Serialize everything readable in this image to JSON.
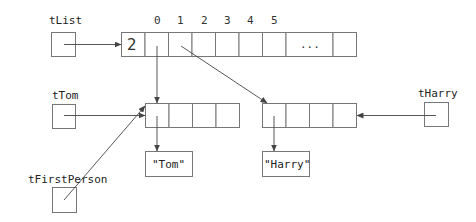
{
  "diagram": {
    "variables": {
      "tList": {
        "label": "tList"
      },
      "tTom": {
        "label": "tTom"
      },
      "tHarry": {
        "label": "tHarry"
      },
      "tFirstPerson": {
        "label": "tFirstPerson"
      }
    },
    "list_array": {
      "count_value": "2",
      "indices": [
        "0",
        "1",
        "2",
        "3",
        "4",
        "5"
      ],
      "ellipsis": "..."
    },
    "objects": {
      "tom_string": "\"Tom\"",
      "harry_string": "\"Harry\""
    },
    "colors": {
      "stroke": "#777777",
      "arrow": "#444444",
      "background": "#ffffff"
    }
  }
}
